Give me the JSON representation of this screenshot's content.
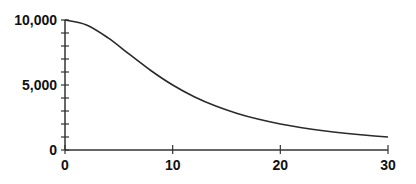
{
  "chart_data": {
    "type": "line",
    "title": "",
    "xlabel": "",
    "ylabel": "",
    "xlim": [
      0,
      30
    ],
    "ylim": [
      0,
      10000
    ],
    "grid": false,
    "legend": null,
    "x_ticks": [
      0,
      10,
      20,
      30
    ],
    "x_tick_labels": [
      "0",
      "10",
      "20",
      "30"
    ],
    "y_ticks_labeled": [
      0,
      5000,
      10000
    ],
    "y_tick_labels": [
      "0",
      "5,000",
      "10,000"
    ],
    "y_minor_tick_step": 1000,
    "series": [
      {
        "name": "curve",
        "x": [
          0,
          2,
          4,
          6,
          8,
          10,
          12,
          14,
          16,
          18,
          20,
          22,
          24,
          26,
          28,
          30
        ],
        "values": [
          10000,
          9615,
          8621,
          7353,
          6098,
          5000,
          4098,
          3378,
          2809,
          2358,
          2000,
          1712,
          1479,
          1289,
          1131,
          1000
        ]
      }
    ],
    "colors": {
      "line": "#2a2a2a",
      "axis": "#333333",
      "text": "#111111"
    }
  }
}
